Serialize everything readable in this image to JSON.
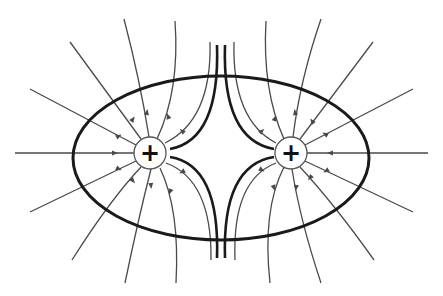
{
  "diagram": {
    "charges": [
      {
        "id": "left-charge",
        "sign": "+",
        "cx": 150,
        "cy": 153,
        "r": 16
      },
      {
        "id": "right-charge",
        "sign": "+",
        "cx": 291,
        "cy": 153,
        "r": 16
      }
    ],
    "equipotential": {
      "cx": 221,
      "cy": 158,
      "rx": 148,
      "ry": 82,
      "stroke_width": 3
    },
    "colors": {
      "background": "#ffffff",
      "field_line": "#4a4a4a",
      "thick_line": "#1a1a1a",
      "charge_fill": "#ffffff",
      "charge_stroke": "#555555",
      "sign": "#111111"
    },
    "field_lines": [
      {
        "name": "left-line-w",
        "d": "M15,153 L134,153",
        "arrow": [
          115,
          153,
          0
        ]
      },
      {
        "name": "left-line-wnw",
        "d": "M30,89 L136,145",
        "arrow": [
          119,
          136,
          28
        ]
      },
      {
        "name": "left-line-nw",
        "d": "M70,42 L141,139",
        "arrow": [
          133,
          119,
          54
        ]
      },
      {
        "name": "left-line-nnw",
        "d": "M124,19 Q140,80 149,137",
        "arrow": [
          147,
          112,
          80
        ]
      },
      {
        "name": "left-line-n",
        "d": "M175,21 Q180,90 157,139",
        "arrow": [
          168,
          116,
          110
        ]
      },
      {
        "name": "left-line-ne",
        "d": "M210,42 Q212,120 165,143",
        "arrow": [
          182,
          131,
          140
        ]
      },
      {
        "name": "left-line-sw",
        "d": "M30,212 L136,161",
        "arrow": [
          119,
          169,
          -25
        ]
      },
      {
        "name": "left-line-ssw",
        "d": "M72,260 Q110,200 141,167",
        "arrow": [
          133,
          181,
          -50
        ]
      },
      {
        "name": "left-line-s",
        "d": "M125,283 Q138,220 151,169",
        "arrow": [
          151,
          186,
          -85
        ]
      },
      {
        "name": "left-line-sse",
        "d": "M176,283 Q180,210 160,168",
        "arrow": [
          170,
          192,
          -110
        ]
      },
      {
        "name": "left-line-se",
        "d": "M211,260 Q212,180 166,163",
        "arrow": [
          182,
          172,
          -150
        ]
      },
      {
        "name": "right-line-e",
        "d": "M428,153 L307,153",
        "arrow": [
          330,
          153,
          180
        ]
      },
      {
        "name": "right-line-ene",
        "d": "M413,89 L305,145",
        "arrow": [
          325,
          134,
          150
        ]
      },
      {
        "name": "right-line-ne",
        "d": "M373,42 L300,139",
        "arrow": [
          312,
          121,
          125
        ]
      },
      {
        "name": "right-line-n",
        "d": "M321,19 Q300,80 293,137",
        "arrow": [
          295,
          112,
          100
        ]
      },
      {
        "name": "right-line-nnw",
        "d": "M266,21 Q262,90 284,139",
        "arrow": [
          275,
          118,
          70
        ]
      },
      {
        "name": "right-line-nw",
        "d": "M234,42 Q232,120 276,143",
        "arrow": [
          262,
          131,
          40
        ]
      },
      {
        "name": "right-line-ese",
        "d": "M413,212 L305,161",
        "arrow": [
          326,
          171,
          -150
        ]
      },
      {
        "name": "right-line-se",
        "d": "M374,260 Q335,205 300,167",
        "arrow": [
          310,
          178,
          -130
        ]
      },
      {
        "name": "right-line-s",
        "d": "M321,283 Q300,220 292,169",
        "arrow": [
          296,
          188,
          -100
        ]
      },
      {
        "name": "right-line-ssw",
        "d": "M270,283 Q262,210 284,167",
        "arrow": [
          274,
          188,
          -70
        ]
      },
      {
        "name": "right-line-sw",
        "d": "M235,260 Q232,180 276,163",
        "arrow": [
          262,
          170,
          -30
        ]
      }
    ],
    "separatrices": [
      {
        "name": "separatrix-upper-left",
        "d": "M217,45 Q220,140 170,149"
      },
      {
        "name": "separatrix-upper-right",
        "d": "M225,45 Q222,140 274,149"
      },
      {
        "name": "separatrix-lower-left",
        "d": "M217,258 Q220,165 170,157"
      },
      {
        "name": "separatrix-lower-right",
        "d": "M225,258 Q222,165 274,157"
      }
    ]
  }
}
